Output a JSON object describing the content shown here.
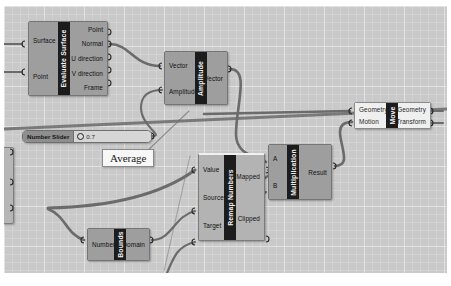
{
  "app": {
    "canvas_label": "grasshopper-node-canvas",
    "background_color": "#c9c9c9",
    "wire_color": "#6b6b6b",
    "node_color": "#9e9e9e",
    "selected_node_color": "#efefef",
    "caption_color": "#1c1c1c"
  },
  "nodes": [
    {
      "id": "evaluate-surface",
      "caption": "Evaluate Surface",
      "inputs": [
        "Surface",
        "Point"
      ],
      "outputs": [
        "Point",
        "Normal",
        "U direction",
        "V direction",
        "Frame"
      ],
      "selected": false
    },
    {
      "id": "amplitude",
      "caption": "Amplitude",
      "inputs": [
        "Vector",
        "Amplitude"
      ],
      "outputs": [
        "Vector"
      ],
      "selected": false
    },
    {
      "id": "multiplication",
      "caption": "Multiplication",
      "inputs": [
        "A",
        "B"
      ],
      "outputs": [
        "Result"
      ],
      "selected": false
    },
    {
      "id": "move",
      "caption": "Move",
      "inputs": [
        "Geometry",
        "Motion"
      ],
      "outputs": [
        "Geometry",
        "Transform"
      ],
      "selected": true
    },
    {
      "id": "remap-numbers",
      "caption": "Remap Numbers",
      "inputs": [
        "Value",
        "Source",
        "Target"
      ],
      "outputs": [
        "Mapped",
        "Clipped"
      ],
      "selected": false
    },
    {
      "id": "bounds",
      "caption": "Bounds",
      "inputs": [
        "Numbers"
      ],
      "outputs": [
        "Domain"
      ],
      "selected": false
    }
  ],
  "slider": {
    "name": "Number Slider",
    "value": "0.7"
  },
  "callout": {
    "text": "Average"
  }
}
